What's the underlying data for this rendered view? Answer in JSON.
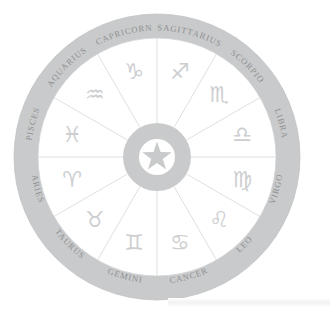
{
  "figure": {
    "center_icon": "star-icon",
    "background_color": "#ffffff",
    "ring_color": "#c9cacb",
    "glyph_color": "#cdced0",
    "label_color": "#8e9092",
    "sector_line_color": "#d6d7d8",
    "sector_count": 12
  },
  "geometry": {
    "center_x": 157,
    "center_y": 157,
    "outer_radius": 143,
    "ring_inner_radius": 119,
    "hub_outer_radius": 34,
    "hub_inner_radius": 18,
    "label_radius": 131,
    "glyph_radius": 88
  },
  "signs": [
    {
      "name": "SAGITTARIUS",
      "glyph": "♐",
      "sector_start_deg": -90,
      "label_mid_deg": -75,
      "glyph_angle_deg": -75
    },
    {
      "name": "SCORPIO",
      "glyph": "♏",
      "sector_start_deg": -60,
      "label_mid_deg": -45,
      "glyph_angle_deg": -45
    },
    {
      "name": "LIBRA",
      "glyph": "♎",
      "sector_start_deg": -30,
      "label_mid_deg": -15,
      "glyph_angle_deg": -15
    },
    {
      "name": "VIRGO",
      "glyph": "♍",
      "sector_start_deg": 0,
      "label_mid_deg": 15,
      "glyph_angle_deg": 15
    },
    {
      "name": "LEO",
      "glyph": "♌",
      "sector_start_deg": 30,
      "label_mid_deg": 45,
      "glyph_angle_deg": 45
    },
    {
      "name": "CANCER",
      "glyph": "♋",
      "sector_start_deg": 60,
      "label_mid_deg": 75,
      "glyph_angle_deg": 75
    },
    {
      "name": "GEMINI",
      "glyph": "♊",
      "sector_start_deg": 90,
      "label_mid_deg": 105,
      "glyph_angle_deg": 105
    },
    {
      "name": "TAURUS",
      "glyph": "♉",
      "sector_start_deg": 120,
      "label_mid_deg": 135,
      "glyph_angle_deg": 135
    },
    {
      "name": "ARIES",
      "glyph": "♈",
      "sector_start_deg": 150,
      "label_mid_deg": 165,
      "glyph_angle_deg": 165
    },
    {
      "name": "PISCES",
      "glyph": "♓",
      "sector_start_deg": 180,
      "label_mid_deg": 195,
      "glyph_angle_deg": 195
    },
    {
      "name": "AQUARIUS",
      "glyph": "♒",
      "sector_start_deg": 210,
      "label_mid_deg": 225,
      "glyph_angle_deg": 225
    },
    {
      "name": "CAPRICORN",
      "glyph": "♑",
      "sector_start_deg": 240,
      "label_mid_deg": 255,
      "glyph_angle_deg": 255
    }
  ]
}
